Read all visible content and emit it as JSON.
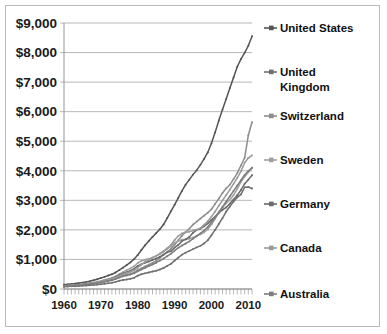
{
  "chart_data": {
    "type": "line",
    "title": "",
    "subtitle": "",
    "xlabel": "",
    "ylabel": "",
    "xlim": [
      1960,
      2011
    ],
    "ylim": [
      0,
      9000
    ],
    "grid": true,
    "legend_position": "right",
    "y_ticks": [
      "$0",
      "$1,000",
      "$2,000",
      "$3,000",
      "$4,000",
      "$5,000",
      "$6,000",
      "$7,000",
      "$8,000",
      "$9,000"
    ],
    "y_tick_values": [
      0,
      1000,
      2000,
      3000,
      4000,
      5000,
      6000,
      7000,
      8000,
      9000
    ],
    "x_ticks": [
      "1960",
      "1970",
      "1980",
      "1990",
      "2000",
      "2010"
    ],
    "x_tick_values": [
      1960,
      1970,
      1980,
      1990,
      2000,
      2010
    ],
    "x_minor_tick_interval": 1,
    "x": [
      1960,
      1961,
      1962,
      1963,
      1964,
      1965,
      1966,
      1967,
      1968,
      1969,
      1970,
      1971,
      1972,
      1973,
      1974,
      1975,
      1976,
      1977,
      1978,
      1979,
      1980,
      1981,
      1982,
      1983,
      1984,
      1985,
      1986,
      1987,
      1988,
      1989,
      1990,
      1991,
      1992,
      1993,
      1994,
      1995,
      1996,
      1997,
      1998,
      1999,
      2000,
      2001,
      2002,
      2003,
      2004,
      2005,
      2006,
      2007,
      2008,
      2009,
      2010,
      2011
    ],
    "series": [
      {
        "name": "United States",
        "color": "#555555",
        "marker": "dot",
        "values": [
          148,
          158,
          170,
          183,
          200,
          217,
          238,
          265,
          295,
          330,
          370,
          410,
          455,
          500,
          560,
          640,
          720,
          810,
          900,
          1010,
          1150,
          1320,
          1480,
          1620,
          1760,
          1890,
          2020,
          2180,
          2400,
          2630,
          2850,
          3080,
          3320,
          3530,
          3700,
          3870,
          4020,
          4200,
          4400,
          4620,
          4930,
          5300,
          5700,
          6070,
          6430,
          6800,
          7160,
          7520,
          7780,
          7990,
          8230,
          8550
        ]
      },
      {
        "name": "United Kingdom",
        "color": "#6f6f6f",
        "marker": "square",
        "values": [
          80,
          84,
          89,
          95,
          102,
          110,
          120,
          130,
          138,
          148,
          163,
          180,
          198,
          215,
          240,
          280,
          305,
          320,
          345,
          375,
          450,
          500,
          530,
          560,
          590,
          620,
          660,
          710,
          780,
          850,
          960,
          1060,
          1160,
          1230,
          1290,
          1350,
          1410,
          1460,
          1540,
          1650,
          1820,
          2000,
          2200,
          2400,
          2620,
          2790,
          2960,
          3100,
          3200,
          3440,
          3450,
          3400
        ]
      },
      {
        "name": "Switzerland",
        "color": "#8d8d8d",
        "marker": "dot",
        "values": [
          110,
          118,
          127,
          137,
          148,
          160,
          175,
          190,
          205,
          222,
          245,
          272,
          300,
          335,
          380,
          430,
          465,
          490,
          520,
          560,
          640,
          700,
          760,
          820,
          880,
          950,
          1050,
          1160,
          1260,
          1360,
          1500,
          1650,
          1800,
          1930,
          2040,
          2180,
          2280,
          2380,
          2480,
          2580,
          2700,
          2880,
          3060,
          3250,
          3410,
          3530,
          3720,
          3920,
          4180,
          4440,
          5200,
          5640
        ]
      },
      {
        "name": "Sweden",
        "color": "#a0a0a0",
        "marker": "cross",
        "values": [
          95,
          104,
          115,
          128,
          143,
          160,
          180,
          200,
          220,
          245,
          275,
          310,
          340,
          375,
          430,
          500,
          570,
          640,
          700,
          770,
          880,
          950,
          990,
          1020,
          1060,
          1120,
          1180,
          1260,
          1360,
          1450,
          1570,
          1620,
          1670,
          1680,
          1700,
          1740,
          1800,
          1850,
          1920,
          2020,
          2180,
          2380,
          2580,
          2760,
          2900,
          3010,
          3180,
          3390,
          3620,
          3800,
          3950,
          4100
        ]
      },
      {
        "name": "Germany",
        "color": "#6a6a6a",
        "marker": "dash",
        "values": [
          90,
          98,
          107,
          118,
          130,
          145,
          160,
          176,
          192,
          212,
          240,
          275,
          312,
          355,
          410,
          480,
          530,
          570,
          620,
          680,
          780,
          840,
          890,
          930,
          980,
          1030,
          1090,
          1160,
          1240,
          1280,
          1400,
          1490,
          1620,
          1680,
          1760,
          1900,
          2000,
          2040,
          2120,
          2220,
          2340,
          2450,
          2580,
          2680,
          2760,
          2890,
          3030,
          3170,
          3350,
          3560,
          3700,
          3850
        ]
      },
      {
        "name": "Canada",
        "color": "#9a9a9a",
        "marker": "dot",
        "values": [
          105,
          112,
          121,
          131,
          143,
          156,
          172,
          190,
          208,
          228,
          255,
          285,
          315,
          345,
          390,
          450,
          500,
          540,
          580,
          630,
          720,
          820,
          920,
          1000,
          1060,
          1120,
          1200,
          1280,
          1380,
          1490,
          1660,
          1790,
          1880,
          1920,
          1940,
          1980,
          2010,
          2060,
          2170,
          2290,
          2450,
          2620,
          2820,
          3000,
          3180,
          3360,
          3560,
          3760,
          3980,
          4270,
          4430,
          4520
        ]
      },
      {
        "name": "Australia",
        "color": "#7d7d7d",
        "marker": "cross",
        "values": [
          92,
          99,
          107,
          116,
          126,
          138,
          151,
          165,
          180,
          197,
          218,
          242,
          268,
          296,
          335,
          390,
          430,
          460,
          490,
          530,
          600,
          660,
          720,
          780,
          830,
          890,
          960,
          1030,
          1110,
          1190,
          1300,
          1390,
          1470,
          1540,
          1610,
          1700,
          1790,
          1880,
          1980,
          2100,
          2260,
          2420,
          2600,
          2780,
          2960,
          3140,
          3320,
          3500,
          3680,
          3860,
          3990,
          4100
        ]
      }
    ]
  },
  "legend": {
    "items": [
      {
        "label": "United States"
      },
      {
        "label": "United Kingdom"
      },
      {
        "label": "Switzerland"
      },
      {
        "label": "Sweden"
      },
      {
        "label": "Germany"
      },
      {
        "label": "Canada"
      },
      {
        "label": "Australia"
      }
    ]
  }
}
